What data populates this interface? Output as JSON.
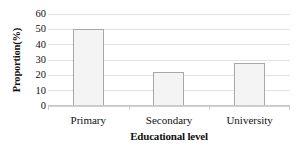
{
  "chart_data": {
    "type": "bar",
    "title": "",
    "subtitle": "",
    "categories": [
      "Primary",
      "Secondary",
      "University"
    ],
    "values": [
      50,
      22,
      28
    ],
    "xlabel": "Educational level",
    "ylabel": "Proportion(%)",
    "ylim": [
      0,
      60
    ],
    "ytick_labels": [
      "60",
      "50",
      "40",
      "30",
      "20",
      "10",
      "0"
    ],
    "ytick_values": [
      60,
      50,
      40,
      30,
      20,
      10,
      0
    ],
    "ytick_step": 10,
    "grid": true,
    "legend": null,
    "annotations": [],
    "colors": {
      "bar_fill": "#f4f4f4",
      "bar_border": "#a8a8a8",
      "gridline": "#e2e2e2",
      "axis_line": "#c9c9c9",
      "text": "#111111",
      "background": "#ffffff"
    }
  }
}
